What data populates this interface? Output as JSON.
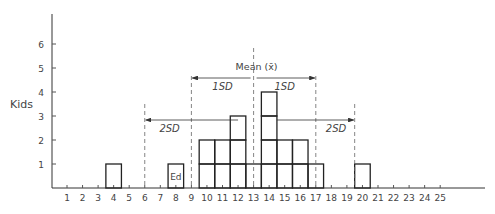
{
  "chart_data": {
    "type": "bar",
    "title": "",
    "xlabel": "",
    "ylabel": "Kids",
    "ylim": [
      0,
      7
    ],
    "xlim": [
      0,
      27
    ],
    "grid": false,
    "y_ticks": [
      1,
      2,
      3,
      4,
      5,
      6
    ],
    "x_ticks": [
      1,
      2,
      3,
      4,
      5,
      6,
      7,
      8,
      9,
      10,
      11,
      12,
      13,
      14,
      15,
      16,
      17,
      18,
      19,
      20,
      21,
      22,
      23,
      24,
      25
    ],
    "categories": [
      4,
      8,
      10,
      11,
      12,
      13,
      14,
      15,
      16,
      17,
      20
    ],
    "values": [
      1,
      1,
      2,
      2,
      3,
      1,
      4,
      2,
      2,
      1,
      1
    ],
    "bar_labels": {
      "8": "Ed"
    },
    "annotations": {
      "mean": {
        "label": "Mean (x̄)",
        "x": 13
      },
      "sd_1": {
        "label": "1SD",
        "left": 9,
        "right": 17
      },
      "sd_2": {
        "label": "2SD",
        "left": 6,
        "right": 19.5
      }
    }
  },
  "labels": {
    "ylabel": "Kids",
    "mean": "Mean (x̄)",
    "sd1": "1SD",
    "sd2": "2SD",
    "ed": "Ed"
  }
}
